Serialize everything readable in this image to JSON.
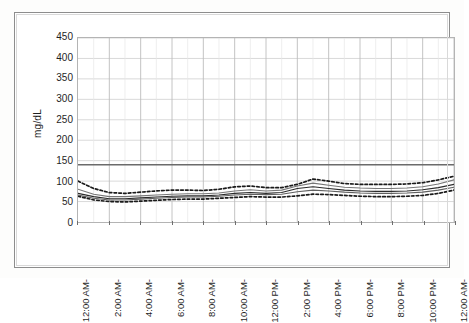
{
  "chart_data": {
    "type": "line",
    "title": "",
    "xlabel": "",
    "ylabel": "mg/dL",
    "ylim": [
      0,
      450
    ],
    "ytick_step": 50,
    "yticks": [
      450,
      400,
      350,
      300,
      250,
      200,
      150,
      100,
      50,
      0
    ],
    "x": [
      0,
      1,
      2,
      3,
      4,
      5,
      6,
      7,
      8,
      9,
      10,
      11,
      12,
      13,
      14,
      15,
      16,
      17,
      18,
      19,
      20,
      21,
      22,
      23,
      24
    ],
    "xticks": [
      0,
      2,
      4,
      6,
      8,
      10,
      12,
      14,
      16,
      18,
      20,
      22,
      24
    ],
    "xtick_labels": [
      "12:00 AM-",
      "2:00 AM-",
      "4:00 AM-",
      "6:00 AM-",
      "8:00 AM-",
      "10:00 AM-",
      "12:00 PM-",
      "2:00 PM-",
      "4:00 PM-",
      "6:00 PM-",
      "8:00 PM-",
      "10:00 PM-",
      "12:00 AM-"
    ],
    "xtick_rotation": -90,
    "grid": true,
    "grid_minor_x": true,
    "legend": "none",
    "reference_line": {
      "name": "target-threshold",
      "value": 140,
      "style": "solid",
      "color": "#6b6b6b"
    },
    "series": [
      {
        "name": "upper-bound",
        "style": "dashed",
        "color": "#1a1a1a",
        "values": [
          100,
          82,
          72,
          70,
          73,
          76,
          78,
          78,
          77,
          80,
          86,
          88,
          84,
          84,
          92,
          105,
          100,
          94,
          92,
          92,
          92,
          93,
          96,
          103,
          112
        ]
      },
      {
        "name": "upper-quartile",
        "style": "solid",
        "color": "#777777",
        "values": [
          80,
          68,
          62,
          62,
          64,
          66,
          68,
          69,
          69,
          71,
          76,
          79,
          76,
          78,
          88,
          95,
          90,
          85,
          83,
          82,
          82,
          83,
          86,
          93,
          103
        ]
      },
      {
        "name": "median",
        "style": "solid",
        "color": "#2b2b2b",
        "values": [
          70,
          62,
          57,
          57,
          59,
          61,
          63,
          64,
          64,
          66,
          70,
          72,
          70,
          72,
          82,
          86,
          82,
          78,
          76,
          75,
          75,
          76,
          79,
          84,
          92
        ]
      },
      {
        "name": "lower-quartile",
        "style": "solid",
        "color": "#606060",
        "values": [
          66,
          58,
          54,
          54,
          56,
          58,
          60,
          61,
          61,
          63,
          66,
          68,
          67,
          68,
          74,
          78,
          76,
          73,
          71,
          70,
          70,
          71,
          73,
          78,
          85
        ]
      },
      {
        "name": "lower-bound",
        "style": "dashed",
        "color": "#1a1a1a",
        "values": [
          63,
          54,
          50,
          49,
          51,
          53,
          55,
          56,
          56,
          58,
          60,
          62,
          61,
          61,
          64,
          68,
          67,
          65,
          63,
          62,
          62,
          63,
          65,
          70,
          78
        ]
      }
    ]
  },
  "axis": {
    "y_title": "mg/dL"
  }
}
